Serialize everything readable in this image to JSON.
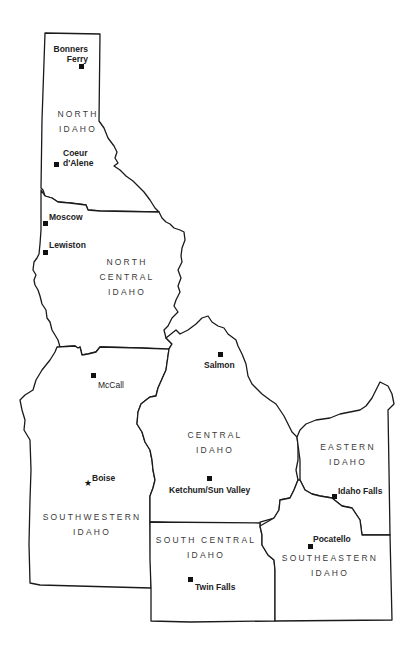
{
  "map": {
    "title": "Idaho Regions",
    "colors": {
      "border": "#1a1a1a",
      "fill": "#ffffff",
      "label": "#3a3a3a",
      "city": "#222222"
    },
    "regions": {
      "north": {
        "line1": "NORTH",
        "line2": "IDAHO"
      },
      "north_central": {
        "line1": "NORTH",
        "line2": "CENTRAL",
        "line3": "IDAHO"
      },
      "southwestern": {
        "line1": "SOUTHWESTERN",
        "line2": "IDAHO"
      },
      "central": {
        "line1": "CENTRAL",
        "line2": "IDAHO"
      },
      "eastern": {
        "line1": "EASTERN",
        "line2": "IDAHO"
      },
      "south_central": {
        "line1": "SOUTH CENTRAL",
        "line2": "IDAHO"
      },
      "southeastern": {
        "line1": "SOUTHEASTERN",
        "line2": "IDAHO"
      }
    },
    "cities": {
      "bonners_ferry": {
        "line1": "Bonners",
        "line2": "Ferry",
        "symbol": "square"
      },
      "coeur_dalene": {
        "line1": "Coeur",
        "line2": "d'Alene",
        "symbol": "square"
      },
      "moscow": {
        "name": "Moscow",
        "symbol": "square"
      },
      "lewiston": {
        "name": "Lewiston",
        "symbol": "square"
      },
      "salmon": {
        "name": "Salmon",
        "symbol": "square"
      },
      "mccall": {
        "name": "McCall",
        "symbol": "square"
      },
      "boise": {
        "name": "Boise",
        "symbol": "star",
        "star_glyph": "★"
      },
      "ketchum": {
        "name": "Ketchum/Sun Valley",
        "symbol": "square"
      },
      "idaho_falls": {
        "name": "Idaho Falls",
        "symbol": "square"
      },
      "pocatello": {
        "name": "Pocatello",
        "symbol": "square"
      },
      "twin_falls": {
        "name": "Twin Falls",
        "symbol": "square"
      }
    }
  }
}
